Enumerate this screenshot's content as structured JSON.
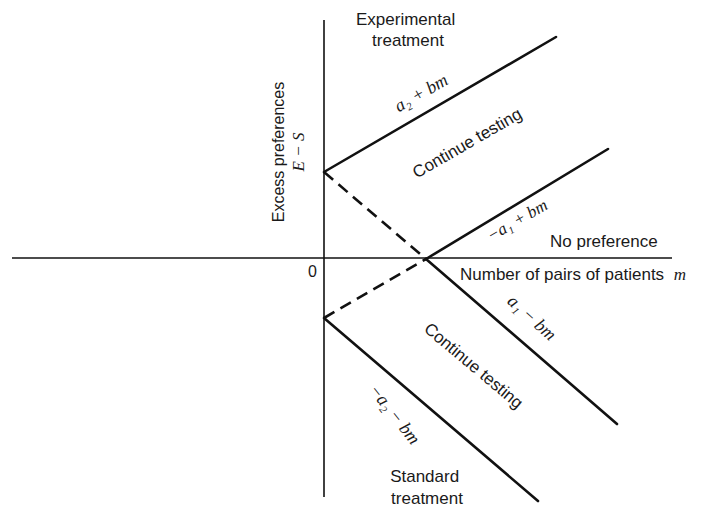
{
  "diagram": {
    "title_top": [
      "Experimental",
      "treatment"
    ],
    "title_bottom": [
      "Standard",
      "treatment"
    ],
    "y_axis_label": [
      "Excess preferences",
      "E − S"
    ],
    "x_axis_label": "Number of pairs of patients",
    "x_axis_var": "m",
    "origin_label": "0",
    "no_preference_label": "No preference",
    "region_upper": "Continue testing",
    "region_lower": "Continue testing",
    "boundaries": {
      "upper_outer": "a₂ + bm",
      "upper_inner": "−a₁ + bm",
      "lower_inner": "a₁ − bm",
      "lower_outer": "−a₂ − bm"
    },
    "colors": {
      "ink": "#111111",
      "background": "#ffffff"
    }
  }
}
